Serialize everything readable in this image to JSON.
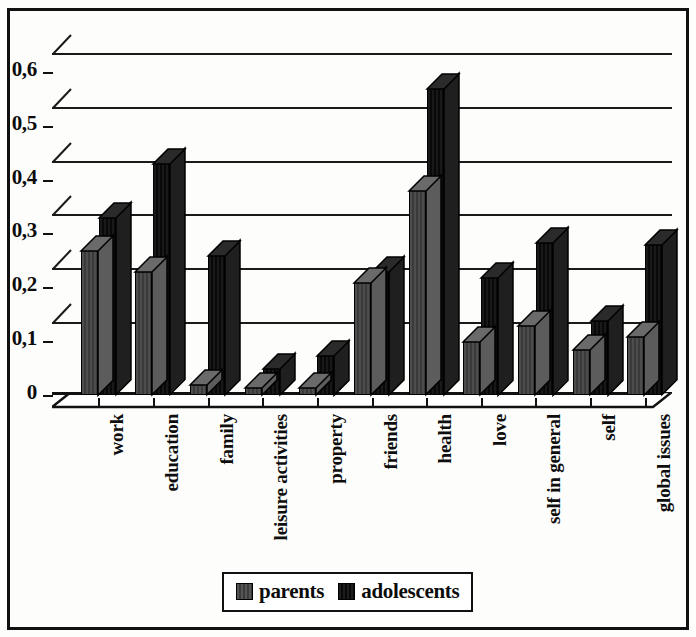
{
  "chart_data": {
    "type": "bar",
    "title": "",
    "xlabel": "",
    "ylabel": "",
    "ylim": [
      0,
      0.65
    ],
    "grid": true,
    "legend_position": "bottom",
    "decimal_separator": ",",
    "tick_labels": [
      "0",
      "0,1",
      "0,2",
      "0,3",
      "0,4",
      "0,5",
      "0,6"
    ],
    "tick_values": [
      0,
      0.1,
      0.2,
      0.3,
      0.4,
      0.5,
      0.6
    ],
    "categories": [
      "work",
      "education",
      "family",
      "leisure activities",
      "property",
      "friends",
      "health",
      "love",
      "self in general",
      "self",
      "global issues"
    ],
    "series": [
      {
        "name": "parents",
        "color": "#4a4a4a",
        "values": [
          0.27,
          0.23,
          0.02,
          0.015,
          0.015,
          0.21,
          0.38,
          0.1,
          0.13,
          0.085,
          0.11
        ]
      },
      {
        "name": "adolescents",
        "color": "#141414",
        "values": [
          0.33,
          0.43,
          0.26,
          0.05,
          0.075,
          0.23,
          0.57,
          0.22,
          0.285,
          0.14,
          0.28
        ]
      }
    ]
  },
  "legend": {
    "entries": [
      {
        "label": "parents",
        "swatch": "parents"
      },
      {
        "label": "adolescents",
        "swatch": "adolescents"
      }
    ]
  }
}
